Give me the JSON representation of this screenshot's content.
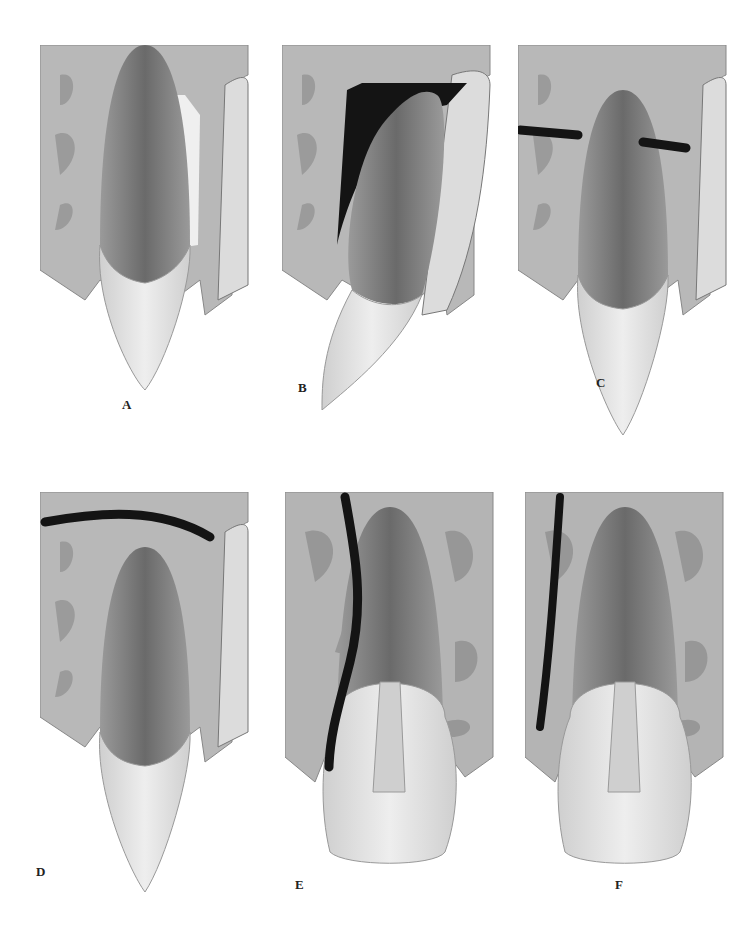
{
  "figure": {
    "panels": [
      {
        "id": "A",
        "label": "A"
      },
      {
        "id": "B",
        "label": "B"
      },
      {
        "id": "C",
        "label": "C"
      },
      {
        "id": "D",
        "label": "D"
      },
      {
        "id": "E",
        "label": "E"
      },
      {
        "id": "F",
        "label": "F"
      }
    ]
  },
  "colors": {
    "bone": "#b4b4b4",
    "bone_dark": "#8a8a8a",
    "cortex": "#d6d6d6",
    "root_outer": "#8c8c8c",
    "root_inner": "#6e6e6e",
    "crown": "#e2e2e2",
    "ligament": "#f2f2f2",
    "black_mark": "#141414"
  }
}
